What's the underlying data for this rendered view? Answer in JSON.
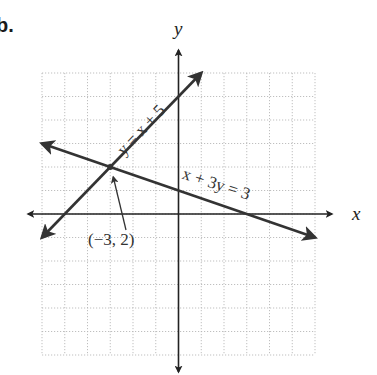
{
  "problem": {
    "label": "b."
  },
  "axes": {
    "x_label": "x",
    "y_label": "y"
  },
  "equations": {
    "line1": "y = x + 5",
    "line2": "x + 3y = 3"
  },
  "intersection": {
    "label": "(−3, 2)",
    "x": -3,
    "y": 2
  },
  "colors": {
    "line": "#333333",
    "axis": "#222222",
    "grid": "#b8b8b8"
  },
  "chart_data": {
    "type": "line",
    "title": "",
    "xlabel": "x",
    "ylabel": "y",
    "xlim": [
      -6,
      6
    ],
    "ylim": [
      -6,
      6
    ],
    "grid": true,
    "grid_step": 1,
    "series": [
      {
        "name": "y = x + 5",
        "equation": "y = x + 5",
        "x": [
          -6,
          1
        ],
        "y": [
          -1,
          6
        ],
        "arrows": "both"
      },
      {
        "name": "x + 3y = 3",
        "equation": "x + 3y = 3",
        "x": [
          -6,
          6
        ],
        "y": [
          3,
          -1
        ],
        "arrows": "both"
      }
    ],
    "annotations": [
      {
        "text": "(−3, 2)",
        "point": [
          -3,
          2
        ],
        "type": "arrow-pointer"
      }
    ],
    "legend": null
  }
}
